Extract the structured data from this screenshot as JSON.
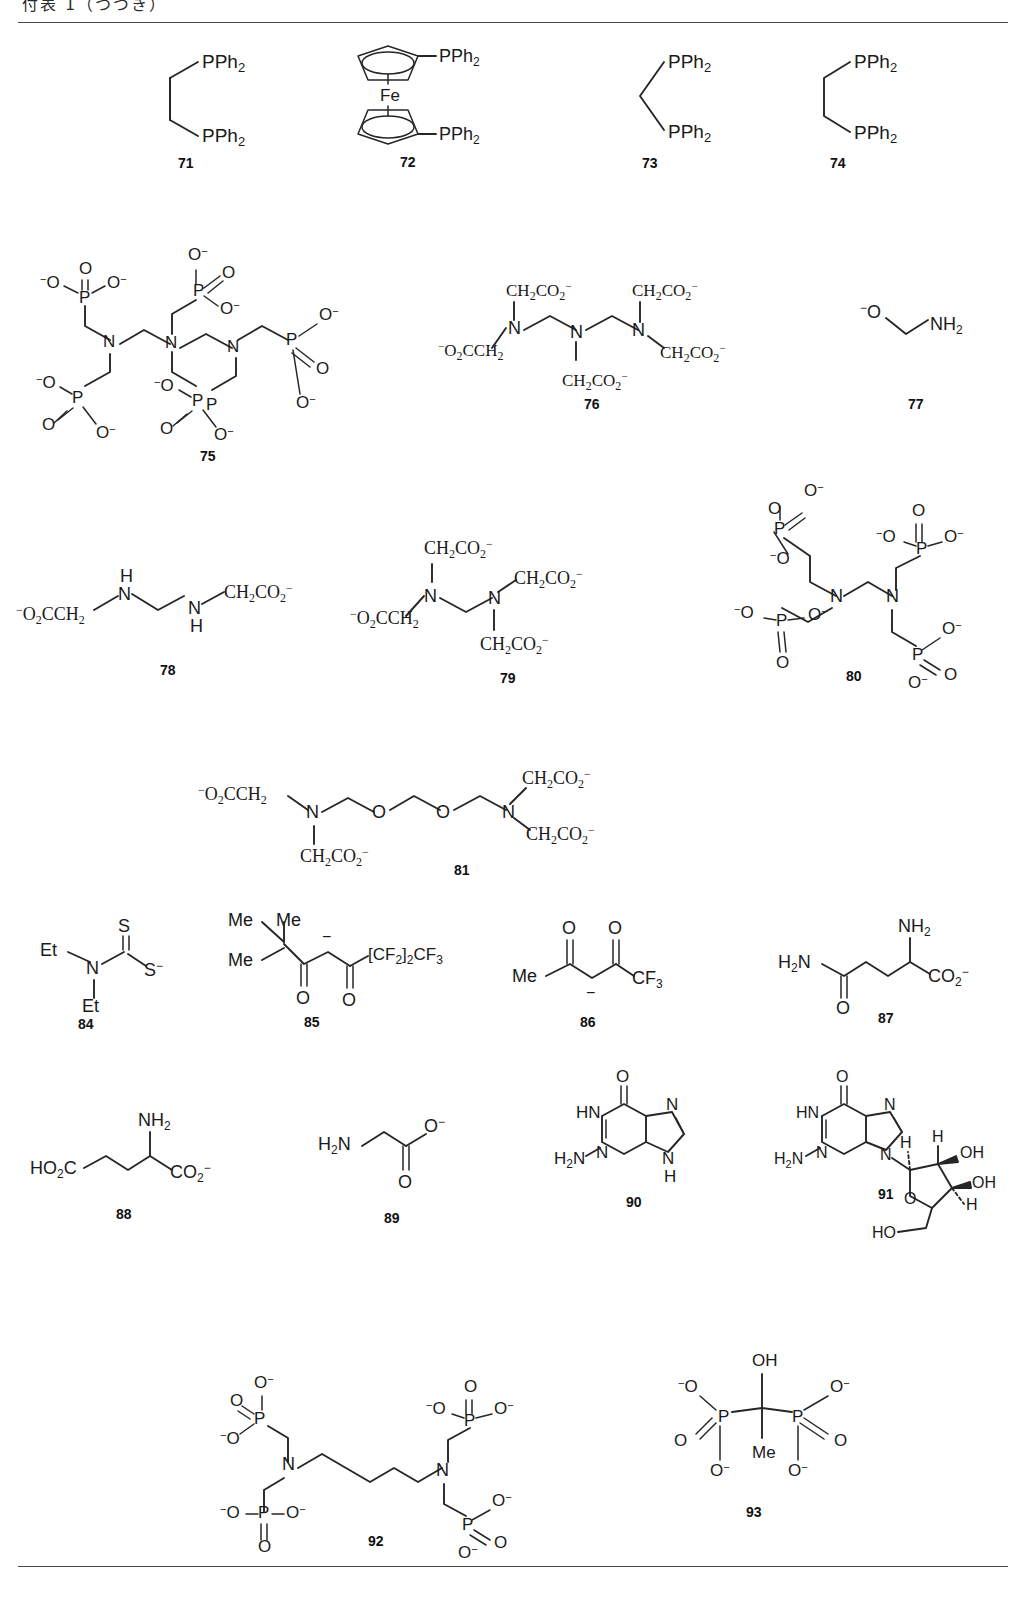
{
  "header": {
    "text": "付表 1（つづき）"
  },
  "page": {
    "width": 1026,
    "height": 1599,
    "background": "#ffffff",
    "ink": "#262626"
  },
  "atoms": {
    "P": "P",
    "N": "N",
    "O": "O",
    "S": "S",
    "Fe": "Fe",
    "H": "H",
    "C": "C"
  },
  "labels": {
    "l71": "71",
    "l72": "72",
    "l73": "73",
    "l74": "74",
    "l75": "75",
    "l76": "76",
    "l77": "77",
    "l78": "78",
    "l79": "79",
    "l80": "80",
    "l81": "81",
    "l84": "84",
    "l85": "85",
    "l86": "86",
    "l87": "87",
    "l88": "88",
    "l89": "89",
    "l90": "90",
    "l91": "91",
    "l92": "92",
    "l93": "93"
  },
  "groups": {
    "pph2": "PPh",
    "pph2_sub": "2",
    "fe": "Fe",
    "o_minus": "O",
    "minus": "−",
    "ch2co2": "CH",
    "ch2co2_sub2": "2",
    "ch2co2_mid": "CO",
    "ch2co2_sub2b": "2",
    "nh2": "NH",
    "nh2_sub": "2",
    "h2n": "H",
    "h2n_sub": "2",
    "h2n_n": "N",
    "et": "Et",
    "me": "Me",
    "cf3": "CF",
    "cf3_sub": "3",
    "cf2": "CF",
    "cf2_sub": "2",
    "fod_tail": "[CF2]2CF3",
    "co2_minus": "CO",
    "ho2c": "HO",
    "ho2c_sub": "2",
    "ho2c_c": "C",
    "oh": "OH",
    "hn": "HN",
    "o2cch2": "O2CCH2",
    "s_minus": "S"
  },
  "structures": [
    {
      "id": "71",
      "label": "71",
      "name": "1,2-bis(diphenylphosphino)ethane",
      "substituents": [
        "PPh2",
        "PPh2"
      ]
    },
    {
      "id": "72",
      "label": "72",
      "name": "1,1'-bis(diphenylphosphino)ferrocene",
      "metal": "Fe",
      "substituents": [
        "PPh2",
        "PPh2"
      ]
    },
    {
      "id": "73",
      "label": "73",
      "name": "bis(diphenylphosphino)methane",
      "substituents": [
        "PPh2",
        "PPh2"
      ]
    },
    {
      "id": "74",
      "label": "74",
      "name": "1,3-bis(diphenylphosphino)propane",
      "substituents": [
        "PPh2",
        "PPh2"
      ]
    },
    {
      "id": "75",
      "label": "75",
      "name": "diethylenetriaminepenta(methylphosphonate)",
      "nitrogens": 3,
      "phosphonates": 5
    },
    {
      "id": "76",
      "label": "76",
      "name": "diethylenetriaminepentaacetate",
      "nitrogens": 3,
      "carboxylates": 5
    },
    {
      "id": "77",
      "label": "77",
      "name": "2-aminoethanolate",
      "substituents": [
        "O-",
        "NH2"
      ]
    },
    {
      "id": "78",
      "label": "78",
      "name": "ethylenediamine-N,N'-diacetate",
      "nitrogens": 2,
      "carboxylates": 2
    },
    {
      "id": "79",
      "label": "79",
      "name": "ethylenediaminetetraacetate",
      "nitrogens": 2,
      "carboxylates": 4
    },
    {
      "id": "80",
      "label": "80",
      "name": "ethylenediaminetetra(methylphosphonate)",
      "nitrogens": 2,
      "phosphonates": 4
    },
    {
      "id": "81",
      "label": "81",
      "name": "ethyleneglycol-bis(2-aminoethylether)tetraacetate",
      "nitrogens": 2,
      "ethers": 2,
      "carboxylates": 4
    },
    {
      "id": "84",
      "label": "84",
      "name": "diethyldithiocarbamate",
      "substituents": [
        "Et",
        "Et",
        "S",
        "S-"
      ]
    },
    {
      "id": "85",
      "label": "85",
      "name": "6,6,7,7,8,8,8-heptafluoro-2,2-dimethyl-3,5-octanedionate",
      "substituents": [
        "Me",
        "Me",
        "Me",
        "[CF2]2CF3"
      ]
    },
    {
      "id": "86",
      "label": "86",
      "name": "1,1,1-trifluoroacetylacetonate",
      "substituents": [
        "Me",
        "CF3"
      ]
    },
    {
      "id": "87",
      "label": "87",
      "name": "glutaminate",
      "substituents": [
        "H2N",
        "NH2",
        "CO2-",
        "O"
      ]
    },
    {
      "id": "88",
      "label": "88",
      "name": "glutamate",
      "substituents": [
        "HO2C",
        "NH2",
        "CO2-"
      ]
    },
    {
      "id": "89",
      "label": "89",
      "name": "glycinate",
      "substituents": [
        "H2N",
        "O-",
        "O"
      ]
    },
    {
      "id": "90",
      "label": "90",
      "name": "guanine",
      "substituents": [
        "HN",
        "O",
        "H2N",
        "N",
        "N",
        "N",
        "H"
      ]
    },
    {
      "id": "91",
      "label": "91",
      "name": "guanosine",
      "substituents": [
        "HN",
        "O",
        "H2N",
        "N",
        "N",
        "OH",
        "OH",
        "HO",
        "H",
        "H",
        "H"
      ]
    },
    {
      "id": "92",
      "label": "92",
      "name": "hexamethylenediaminetetra(methylphosphonate)",
      "nitrogens": 2,
      "phosphonates": 4
    },
    {
      "id": "93",
      "label": "93",
      "name": "1-hydroxyethylidenediphosphonate",
      "substituents": [
        "OH",
        "Me"
      ],
      "phosphonates": 2
    }
  ]
}
